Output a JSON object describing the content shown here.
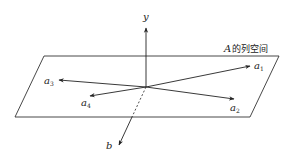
{
  "diagram": {
    "plane_label_var": "A",
    "plane_label_text": "的列空间",
    "vectors": [
      {
        "name": "y",
        "sub": ""
      },
      {
        "name": "a",
        "sub": "1"
      },
      {
        "name": "a",
        "sub": "2"
      },
      {
        "name": "a",
        "sub": "3"
      },
      {
        "name": "a",
        "sub": "4"
      },
      {
        "name": "b",
        "sub": ""
      }
    ]
  }
}
